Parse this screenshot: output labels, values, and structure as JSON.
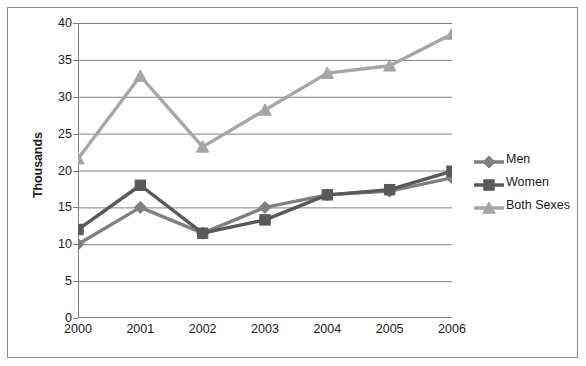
{
  "chart_data": {
    "type": "line",
    "title": "",
    "xlabel": "",
    "ylabel": "Thousands",
    "categories": [
      "2000",
      "2001",
      "2002",
      "2003",
      "2004",
      "2005",
      "2006"
    ],
    "x": [
      2000,
      2001,
      2002,
      2003,
      2004,
      2005,
      2006
    ],
    "ylim": [
      0,
      40
    ],
    "ytick_step": 5,
    "yticks": [
      "0",
      "5",
      "10",
      "15",
      "20",
      "25",
      "30",
      "35",
      "40"
    ],
    "grid": "horizontal",
    "legend_position": "right",
    "series": [
      {
        "name": "Men",
        "marker": "diamond",
        "color": "#808080",
        "values": [
          10.0,
          15.0,
          11.5,
          15.0,
          16.7,
          17.2,
          19.0
        ]
      },
      {
        "name": "Women",
        "marker": "square",
        "color": "#595959",
        "values": [
          12.0,
          18.0,
          11.5,
          13.3,
          16.7,
          17.4,
          19.9
        ]
      },
      {
        "name": "Both Sexes",
        "marker": "triangle",
        "color": "#a6a6a6",
        "values": [
          21.6,
          32.8,
          23.2,
          28.2,
          33.2,
          34.2,
          38.5
        ]
      }
    ]
  },
  "axis": {
    "y_title": "Thousands"
  },
  "legend": {
    "items": [
      {
        "label": "Men"
      },
      {
        "label": "Women"
      },
      {
        "label": "Both Sexes"
      }
    ]
  },
  "colors": {
    "men": "#808080",
    "women": "#595959",
    "both_sexes": "#a6a6a6",
    "gridline": "#808080",
    "axis": "#808080",
    "frame": "#8a8a8a",
    "text": "#1a1a1a",
    "background": "#ffffff"
  }
}
